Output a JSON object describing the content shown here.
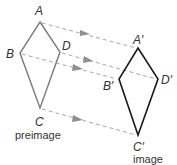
{
  "diagram": {
    "colors": {
      "preimage_stroke": "#7a7a7a",
      "image_stroke": "#1a1a1a",
      "arrow": "#9a9a9a",
      "text": "#333333"
    },
    "preimage": {
      "caption": "preimage",
      "vertices": [
        {
          "name": "A",
          "x": 40,
          "y": 22
        },
        {
          "name": "D",
          "x": 60,
          "y": 52
        },
        {
          "name": "C",
          "x": 40,
          "y": 108
        },
        {
          "name": "B",
          "x": 20,
          "y": 53
        }
      ]
    },
    "image": {
      "caption": "image",
      "vertices": [
        {
          "name": "A′",
          "x": 138,
          "y": 48
        },
        {
          "name": "D′",
          "x": 158,
          "y": 79
        },
        {
          "name": "C′",
          "x": 138,
          "y": 135
        },
        {
          "name": "B′",
          "x": 119,
          "y": 79
        }
      ]
    },
    "labels": {
      "A": "A",
      "B": "B",
      "C": "C",
      "D": "D",
      "A_prime": "A′",
      "B_prime": "B′",
      "C_prime": "C′",
      "D_prime": "D′"
    }
  }
}
